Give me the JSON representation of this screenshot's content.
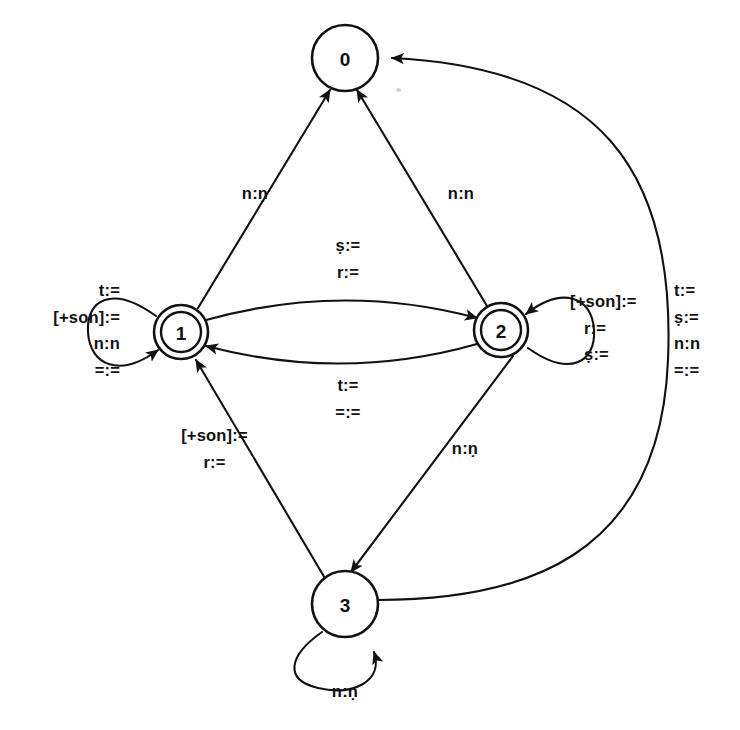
{
  "diagram": {
    "type": "finite-state-transducer",
    "background_color": "#ffffff",
    "stroke_color": "#111111"
  },
  "states": [
    {
      "id": "0",
      "label": "0",
      "x": 345,
      "y": 58,
      "radius": 33,
      "accepting": false
    },
    {
      "id": "1",
      "label": "1",
      "x": 181,
      "y": 332,
      "radius": 27,
      "accepting": true
    },
    {
      "id": "2",
      "label": "2",
      "x": 501,
      "y": 330,
      "radius": 27,
      "accepting": true
    },
    {
      "id": "3",
      "label": "3",
      "x": 345,
      "y": 604,
      "radius": 33,
      "accepting": false
    }
  ],
  "transitions": [
    {
      "id": "t1-0",
      "from": "1",
      "to": "0",
      "kind": "straight",
      "labels": [
        "n:ṇ"
      ],
      "label_x": 215,
      "label_y": 180,
      "align": "center"
    },
    {
      "id": "t2-0",
      "from": "2",
      "to": "0",
      "kind": "straight",
      "labels": [
        "n:n"
      ],
      "label_x": 421,
      "label_y": 180,
      "align": "center"
    },
    {
      "id": "t1-2",
      "from": "1",
      "to": "2",
      "kind": "curve-upper",
      "labels": [
        "ṣ:=",
        "r:="
      ],
      "label_x": 308,
      "label_y": 232,
      "align": "center"
    },
    {
      "id": "t2-1",
      "from": "2",
      "to": "1",
      "kind": "curve-lower",
      "labels": [
        "t:=",
        "=:="
      ],
      "label_x": 308,
      "label_y": 372,
      "align": "center"
    },
    {
      "id": "t3-1",
      "from": "3",
      "to": "1",
      "kind": "straight",
      "labels": [
        "[+son]:=",
        "r:="
      ],
      "label_x": 152,
      "label_y": 422,
      "align": "center"
    },
    {
      "id": "t2-3",
      "from": "2",
      "to": "3",
      "kind": "straight",
      "labels": [
        "n:ṇ"
      ],
      "label_x": 425,
      "label_y": 435,
      "align": "center"
    },
    {
      "id": "t3-0",
      "from": "3",
      "to": "0",
      "kind": "big-right-curve",
      "labels": [
        "t:=",
        "ṣ:=",
        "n:n",
        "=:="
      ],
      "label_x": 674,
      "label_y": 277,
      "align": "left-a"
    }
  ],
  "self_loops": [
    {
      "id": "loop-1",
      "state": "1",
      "side": "left",
      "labels": [
        "t:=",
        "[+son]:=",
        "n:n",
        "=:="
      ],
      "label_x": 2,
      "label_y": 277,
      "align": "right-a",
      "label_width": 118
    },
    {
      "id": "loop-2",
      "state": "2",
      "side": "right",
      "labels": [
        "[+son]:=",
        "r:=",
        "ṣ:="
      ],
      "label_x": 570,
      "label_y": 288,
      "align": "left-a",
      "label_width": 102
    },
    {
      "id": "loop-3",
      "state": "3",
      "side": "bottom",
      "labels": [
        "n:ṇ"
      ],
      "label_x": 305,
      "label_y": 678,
      "align": "center",
      "label_width": 80
    }
  ]
}
